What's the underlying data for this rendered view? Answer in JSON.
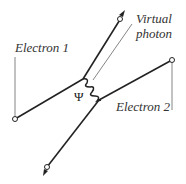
{
  "diagram": {
    "type": "feynman-diagram",
    "labels": {
      "electron1": "Electron 1",
      "electron2": "Electron 2",
      "virtual_photon_line1": "Virtual",
      "virtual_photon_line2": "photon",
      "psi": "Ψ"
    },
    "colors": {
      "line": "#222222",
      "label": "#333333",
      "leader": "#555555"
    }
  }
}
